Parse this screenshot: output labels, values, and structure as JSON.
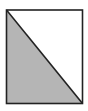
{
  "diagram": {
    "shape": "rectangle-split-by-diagonal",
    "diagonal": "top-left to bottom-right",
    "shaded_region": "lower-left triangle",
    "unshaded_region": "upper-right triangle",
    "colors": {
      "shade": "#b5b5b5",
      "stroke": "#222222",
      "background": "#ffffff"
    }
  }
}
